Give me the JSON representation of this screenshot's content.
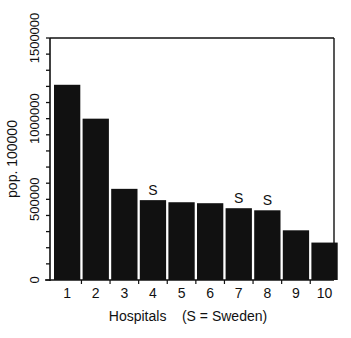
{
  "chart_data": {
    "type": "bar",
    "title": "",
    "xlabel": "Hospitals    (S = Sweden)",
    "ylabel": "pop. 100000",
    "categories": [
      "1",
      "2",
      "3",
      "4",
      "5",
      "6",
      "7",
      "8",
      "9",
      "10"
    ],
    "values": [
      1210000,
      1000000,
      565000,
      495000,
      482000,
      476000,
      445000,
      432000,
      308000,
      232000
    ],
    "bar_annotations": [
      "",
      "",
      "",
      "S",
      "",
      "",
      "S",
      "S",
      "",
      ""
    ],
    "annotation_legend": "S = Sweden",
    "ylim": [
      0,
      1500000
    ],
    "yticks_major": [
      0,
      500000,
      1000000,
      1500000
    ],
    "ytick_labels": [
      "0",
      "500000",
      "1000000",
      "1500000"
    ],
    "yticks_minor_step": 100000,
    "grid": false,
    "legend": null,
    "colors": {
      "bar": "#111111",
      "axis": "#111111",
      "background": "#ffffff"
    }
  }
}
